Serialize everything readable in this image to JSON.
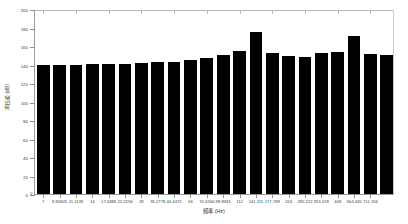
{
  "chart_data": {
    "type": "bar",
    "title": "",
    "xlabel": "频率 (Hz)",
    "ylabel": "声压级 (dB)",
    "ylim": [
      0,
      200
    ],
    "yticks": [
      0,
      20,
      40,
      60,
      80,
      100,
      120,
      140,
      160,
      180,
      200
    ],
    "ytick_labels": [
      "0",
      "20",
      "40",
      "60",
      "80",
      "100",
      "120",
      "140",
      "160",
      "180",
      "200"
    ],
    "grid": false,
    "legend": null,
    "bar_color": "#000000",
    "categories": [
      "7",
      "8.81845",
      "11.1139",
      "14",
      "17.6389",
      "22.2256",
      "28",
      "35.2778",
      "44.4472",
      "56",
      "70.5556",
      "88.8945",
      "112",
      "141.111",
      "177.789",
      "224",
      "282.222",
      "355.578",
      "448",
      "564.445",
      "711.156",
      "896"
    ],
    "xtick_labels_shown": [
      "7",
      "8.81845",
      "11.1139",
      "14",
      "17.6389",
      "22.2256",
      "28",
      "35.2778",
      "44.4472",
      "56",
      "70.5556",
      "88.8945",
      "112",
      "141.111",
      "177.789",
      "224",
      "282.222",
      "355.578",
      "448",
      "564.445",
      "711.156"
    ],
    "values": [
      140,
      140,
      140,
      140.5,
      140.5,
      141,
      142,
      143,
      143,
      145,
      147,
      150,
      155,
      175,
      152,
      149,
      148,
      152,
      153,
      171,
      151,
      150
    ],
    "zero_label": "0"
  }
}
